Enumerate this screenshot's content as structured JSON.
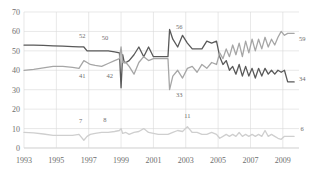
{
  "chart_data": {
    "type": "line",
    "title": "",
    "xlabel": "",
    "ylabel": "",
    "xlim": [
      1993,
      2010
    ],
    "ylim": [
      0,
      70
    ],
    "grid": true,
    "legend": "none",
    "ytick_labels": [
      "0",
      "10",
      "20",
      "30",
      "40",
      "50",
      "60",
      "70"
    ],
    "ytick_values": [
      0,
      10,
      20,
      30,
      40,
      50,
      60,
      70
    ],
    "xtick_labels": [
      "1993",
      "1995",
      "1997",
      "1999",
      "2001",
      "2003",
      "2005",
      "2007",
      "2009"
    ],
    "xtick_values": [
      1993,
      1995,
      1997,
      1999,
      2001,
      2003,
      2005,
      2007,
      2009
    ],
    "colors": {
      "series_dark": "#595959",
      "series_mid": "#a6a6a6",
      "series_light": "#cfcfcf",
      "grid": "#d9d9d9",
      "axis": "#b9b9b9",
      "text": "#6e6e6e"
    },
    "series": [
      {
        "name": "series-dark",
        "color": "#595959",
        "x": [
          1993.0,
          1993.6,
          1994.2,
          1994.8,
          1995.4,
          1996.0,
          1996.4,
          1996.7,
          1996.9,
          1997.1,
          1997.4,
          1997.8,
          1998.2,
          1998.6,
          1998.9,
          1999.0,
          1999.1,
          1999.2,
          1999.3,
          1999.5,
          1999.8,
          2000.1,
          2000.4,
          2000.7,
          2001.0,
          2001.3,
          2001.6,
          2001.9,
          2002.0,
          2002.2,
          2002.5,
          2002.8,
          2003.1,
          2003.4,
          2003.7,
          2004.0,
          2004.3,
          2004.6,
          2004.9,
          2005.1,
          2005.3,
          2005.5,
          2005.7,
          2005.9,
          2006.1,
          2006.3,
          2006.5,
          2006.7,
          2006.9,
          2007.1,
          2007.3,
          2007.5,
          2007.7,
          2007.9,
          2008.1,
          2008.3,
          2008.5,
          2008.7,
          2008.9,
          2009.1,
          2009.3,
          2009.5,
          2009.7
        ],
        "y": [
          53,
          53,
          52.8,
          52.6,
          52.4,
          52.2,
          52,
          52,
          50,
          50,
          50,
          50,
          50,
          49.5,
          49,
          31,
          48,
          44,
          44,
          45,
          48,
          52,
          47,
          52,
          47,
          47,
          47,
          47,
          61,
          56,
          52,
          58,
          54,
          51,
          51,
          51,
          55,
          54,
          55,
          47,
          43,
          45,
          40,
          42,
          38,
          43,
          37,
          42,
          37,
          41,
          36,
          41,
          37,
          41,
          38,
          40,
          38,
          40,
          39,
          40,
          34,
          34,
          34
        ]
      },
      {
        "name": "series-mid",
        "color": "#a6a6a6",
        "x": [
          1993.0,
          1993.6,
          1994.2,
          1994.8,
          1995.4,
          1996.0,
          1996.4,
          1996.7,
          1996.9,
          1997.1,
          1997.4,
          1997.8,
          1998.2,
          1998.6,
          1998.9,
          1999.0,
          1999.1,
          1999.2,
          1999.3,
          1999.5,
          1999.8,
          2000.1,
          2000.4,
          2000.7,
          2001.0,
          2001.3,
          2001.6,
          2001.9,
          2002.0,
          2002.2,
          2002.5,
          2002.8,
          2003.1,
          2003.4,
          2003.7,
          2004.0,
          2004.3,
          2004.6,
          2004.9,
          2005.1,
          2005.3,
          2005.5,
          2005.7,
          2005.9,
          2006.1,
          2006.3,
          2006.5,
          2006.7,
          2006.9,
          2007.1,
          2007.3,
          2007.5,
          2007.7,
          2007.9,
          2008.1,
          2008.3,
          2008.5,
          2008.7,
          2008.9,
          2009.1,
          2009.3,
          2009.5,
          2009.7
        ],
        "y": [
          40,
          40.5,
          41.2,
          42,
          42,
          41.5,
          41,
          45,
          44,
          43,
          42.5,
          42,
          43.5,
          45,
          46,
          52,
          44,
          44,
          44,
          42,
          38,
          44,
          47,
          45,
          46,
          46,
          46,
          46,
          30,
          37,
          40,
          36,
          41,
          42,
          39,
          43,
          41,
          44,
          43,
          49,
          46,
          51,
          47,
          53,
          48,
          54,
          47,
          55,
          49,
          56,
          50,
          56,
          51,
          57,
          52,
          56,
          53,
          57,
          60,
          58,
          59,
          59,
          59
        ]
      },
      {
        "name": "series-light",
        "color": "#cfcfcf",
        "x": [
          1993.0,
          1993.6,
          1994.2,
          1994.8,
          1995.4,
          1996.0,
          1996.4,
          1996.7,
          1996.9,
          1997.1,
          1997.4,
          1997.8,
          1998.2,
          1998.6,
          1998.9,
          1999.0,
          1999.1,
          1999.3,
          1999.5,
          1999.8,
          2000.1,
          2000.4,
          2000.7,
          2001.0,
          2001.3,
          2001.6,
          2001.9,
          2002.2,
          2002.5,
          2002.8,
          2003.1,
          2003.4,
          2003.7,
          2004.0,
          2004.3,
          2004.6,
          2004.9,
          2005.1,
          2005.3,
          2005.5,
          2005.7,
          2005.9,
          2006.1,
          2006.3,
          2006.5,
          2006.7,
          2006.9,
          2007.1,
          2007.3,
          2007.5,
          2007.7,
          2007.9,
          2008.1,
          2008.3,
          2008.5,
          2008.7,
          2008.9,
          2009.1,
          2009.3,
          2009.5,
          2009.7
        ],
        "y": [
          8,
          7.8,
          7.2,
          6.5,
          6.5,
          6.5,
          7,
          4,
          6,
          7,
          7.5,
          8,
          8,
          8.5,
          9,
          10,
          7.5,
          8,
          7,
          8,
          8.5,
          10,
          8,
          7.5,
          7,
          7,
          7,
          8,
          9,
          8.5,
          11,
          8,
          8,
          7,
          7,
          8,
          7,
          5,
          6,
          7,
          6,
          7,
          6,
          8,
          6,
          7,
          6,
          7,
          6,
          7,
          6,
          9,
          6,
          7,
          6,
          5,
          4.5,
          6,
          6,
          6,
          6
        ]
      }
    ],
    "annotations": [
      {
        "text": "52",
        "x": 1996.6,
        "y": 56.5,
        "series": "series-dark"
      },
      {
        "text": "50",
        "x": 1998.0,
        "y": 55.5,
        "series": "series-dark"
      },
      {
        "text": "56",
        "x": 2002.6,
        "y": 61.5,
        "series": "series-dark"
      },
      {
        "text": "34",
        "x": 2010.2,
        "y": 34.5,
        "series": "series-dark"
      },
      {
        "text": "41",
        "x": 1996.6,
        "y": 36.0,
        "series": "series-mid"
      },
      {
        "text": "42",
        "x": 1998.3,
        "y": 36.0,
        "series": "series-mid"
      },
      {
        "text": "33",
        "x": 2002.6,
        "y": 26.5,
        "series": "series-mid"
      },
      {
        "text": "59",
        "x": 2010.2,
        "y": 55.0,
        "series": "series-mid"
      },
      {
        "text": "7",
        "x": 1996.5,
        "y": 13.0,
        "series": "series-light"
      },
      {
        "text": "8",
        "x": 1998.0,
        "y": 13.5,
        "series": "series-light"
      },
      {
        "text": "11",
        "x": 2003.1,
        "y": 15.5,
        "series": "series-light"
      },
      {
        "text": "6",
        "x": 2010.2,
        "y": 8.5,
        "series": "series-light"
      }
    ]
  }
}
